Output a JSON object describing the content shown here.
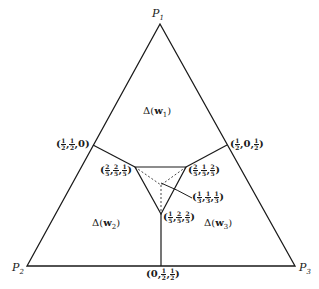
{
  "vertices": {
    "p1": {
      "name": "P",
      "sub": "1"
    },
    "p2": {
      "name": "P",
      "sub": "2"
    },
    "p3": {
      "name": "P",
      "sub": "3"
    }
  },
  "regions": {
    "w1": {
      "prefix": "Δ(",
      "var": "w",
      "sub": "1",
      "suffix": ")"
    },
    "w2": {
      "prefix": "Δ(",
      "var": "w",
      "sub": "2",
      "suffix": ")"
    },
    "w3": {
      "prefix": "Δ(",
      "var": "w",
      "sub": "3",
      "suffix": ")"
    }
  },
  "points": {
    "mid12": {
      "open": "(",
      "a": [
        "1",
        "2"
      ],
      "b": [
        "1",
        "2"
      ],
      "c": "0",
      "close": ")"
    },
    "mid13": {
      "open": "(",
      "a": [
        "1",
        "2"
      ],
      "b": "0",
      "c": [
        "1",
        "2"
      ],
      "close": ")"
    },
    "mid23": {
      "open": "(",
      "a": "0",
      "b": [
        "1",
        "2"
      ],
      "c": [
        "1",
        "2"
      ],
      "close": ")"
    },
    "inner_left": {
      "open": "(",
      "a": [
        "2",
        "5"
      ],
      "b": [
        "2",
        "5"
      ],
      "c": [
        "1",
        "5"
      ],
      "close": ")"
    },
    "inner_right": {
      "open": "(",
      "a": [
        "2",
        "5"
      ],
      "b": [
        "1",
        "5"
      ],
      "c": [
        "2",
        "5"
      ],
      "close": ")"
    },
    "inner_bottom": {
      "open": "(",
      "a": [
        "1",
        "5"
      ],
      "b": [
        "2",
        "5"
      ],
      "c": [
        "2",
        "5"
      ],
      "close": ")"
    },
    "center": {
      "open": "(",
      "a": [
        "1",
        "3"
      ],
      "b": [
        "1",
        "3"
      ],
      "c": [
        "1",
        "3"
      ],
      "close": ")"
    }
  },
  "colors": {
    "ink": "#1a1a1a",
    "background": "#ffffff"
  }
}
